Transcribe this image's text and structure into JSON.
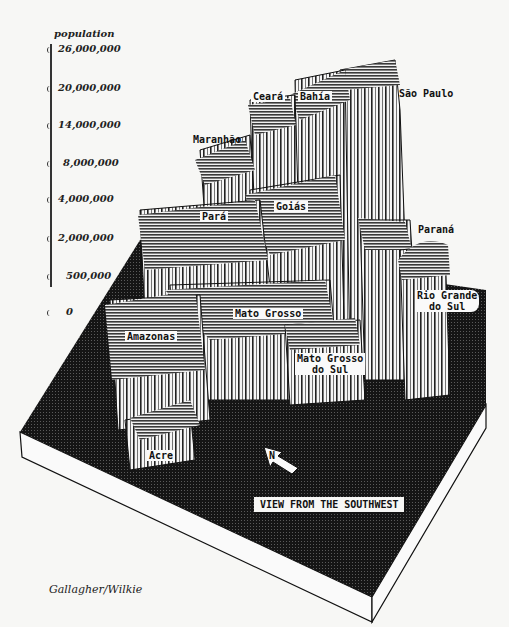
{
  "figure": {
    "view_label": "VIEW FROM THE SOUTHWEST",
    "north_arrow_label": "N",
    "credit": "Gallagher/Wilkie"
  },
  "scale": {
    "title": "population",
    "ticks": [
      {
        "label": "26,000,000",
        "value": 26000000
      },
      {
        "label": "20,000,000",
        "value": 20000000
      },
      {
        "label": "14,000,000",
        "value": 14000000
      },
      {
        "label": "8,000,000",
        "value": 8000000
      },
      {
        "label": "4,000,000",
        "value": 4000000
      },
      {
        "label": "2,000,000",
        "value": 2000000
      },
      {
        "label": "500,000",
        "value": 500000
      },
      {
        "label": "0",
        "value": 0
      }
    ]
  },
  "states": [
    {
      "name": "Ceará"
    },
    {
      "name": "Bahía"
    },
    {
      "name": "São Paulo"
    },
    {
      "name": "Maranhão"
    },
    {
      "name": "Pará"
    },
    {
      "name": "Goiás"
    },
    {
      "name": "Paraná"
    },
    {
      "name": "Rio Grande do Sul",
      "line1": "Rio Grande",
      "line2": "do Sul"
    },
    {
      "name": "Mato Grosso"
    },
    {
      "name": "Amazonas"
    },
    {
      "name": "Mato Grosso do Sul",
      "line1": "Mato Grosso",
      "line2": "do Sul"
    },
    {
      "name": "Acre"
    }
  ],
  "colors": {
    "board_top": "#1a1a1a",
    "board_side": "#fafafa",
    "prism_wall": "#f4f4f4",
    "prism_top": "#555555",
    "ink": "#111111"
  }
}
